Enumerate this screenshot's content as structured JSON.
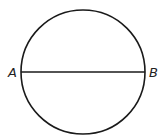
{
  "diagram": {
    "type": "geometry",
    "shape": "circle",
    "circle": {
      "cx": 83,
      "cy": 72,
      "r": 62
    },
    "chord": {
      "from": "A",
      "to": "B",
      "is_diameter": true
    },
    "points": [
      {
        "name": "A",
        "x": 21,
        "y": 72,
        "label": "A"
      },
      {
        "name": "B",
        "x": 145,
        "y": 72,
        "label": "B"
      }
    ],
    "stroke_color": "#1a1a1a",
    "background_color": "#ffffff"
  }
}
